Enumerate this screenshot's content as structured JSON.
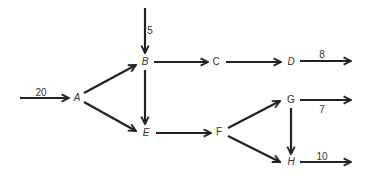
{
  "diagram": {
    "type": "flow-network",
    "nodes": [
      {
        "id": "A",
        "label": "A",
        "x": 77,
        "y": 98,
        "italic": true
      },
      {
        "id": "B",
        "label": "B",
        "x": 145,
        "y": 62,
        "italic": true
      },
      {
        "id": "C",
        "label": "C",
        "x": 216,
        "y": 62,
        "italic": false
      },
      {
        "id": "D",
        "label": "D",
        "x": 291,
        "y": 62,
        "italic": true
      },
      {
        "id": "E",
        "label": "E",
        "x": 146,
        "y": 133,
        "italic": true
      },
      {
        "id": "F",
        "label": "F",
        "x": 219,
        "y": 132,
        "italic": false
      },
      {
        "id": "G",
        "label": "G",
        "x": 291,
        "y": 100,
        "italic": false
      },
      {
        "id": "H",
        "label": "H",
        "x": 291,
        "y": 162,
        "italic": true
      }
    ],
    "edges": [
      {
        "from": "A",
        "to": "B",
        "x1": 84,
        "y1": 93,
        "x2": 136,
        "y2": 65
      },
      {
        "from": "A",
        "to": "E",
        "x1": 84,
        "y1": 102,
        "x2": 136,
        "y2": 131
      },
      {
        "from": "B",
        "to": "C",
        "x1": 154,
        "y1": 62,
        "x2": 208,
        "y2": 62
      },
      {
        "from": "B",
        "to": "E",
        "x1": 145,
        "y1": 70,
        "x2": 145,
        "y2": 124
      },
      {
        "from": "C",
        "to": "D",
        "x1": 226,
        "y1": 62,
        "x2": 281,
        "y2": 62
      },
      {
        "from": "E",
        "to": "F",
        "x1": 156,
        "y1": 133,
        "x2": 211,
        "y2": 133
      },
      {
        "from": "F",
        "to": "G",
        "x1": 228,
        "y1": 128,
        "x2": 280,
        "y2": 101
      },
      {
        "from": "F",
        "to": "H",
        "x1": 228,
        "y1": 136,
        "x2": 280,
        "y2": 162
      },
      {
        "from": "G",
        "to": "H",
        "x1": 291,
        "y1": 108,
        "x2": 291,
        "y2": 154
      }
    ],
    "inflows": [
      {
        "to": "A",
        "value": "20",
        "x1": 20,
        "y1": 98,
        "x2": 69,
        "y2": 98,
        "label_x": 41,
        "label_y": 93
      },
      {
        "to": "B",
        "value": "5",
        "x1": 145,
        "y1": 8,
        "x2": 145,
        "y2": 53,
        "label_x": 150,
        "label_y": 31
      }
    ],
    "outflows": [
      {
        "from": "D",
        "value": "8",
        "x1": 300,
        "y1": 61,
        "x2": 351,
        "y2": 61,
        "label_x": 322,
        "label_y": 55
      },
      {
        "from": "G",
        "value": "7",
        "x1": 300,
        "y1": 100,
        "x2": 351,
        "y2": 100,
        "label_x": 322,
        "label_y": 110
      },
      {
        "from": "H",
        "value": "10",
        "x1": 300,
        "y1": 162,
        "x2": 351,
        "y2": 162,
        "label_x": 322,
        "label_y": 157
      }
    ]
  }
}
